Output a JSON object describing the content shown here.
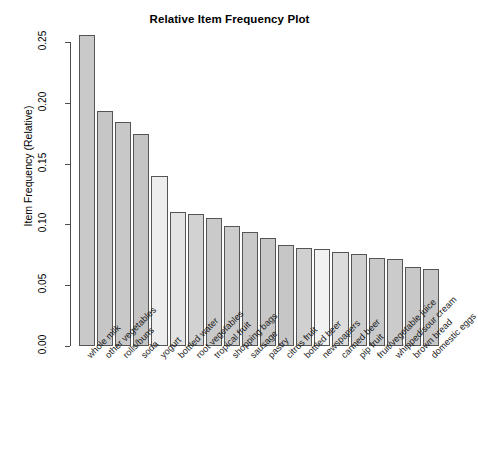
{
  "chart_data": {
    "type": "bar",
    "title": "Relative Item Frequency Plot",
    "xlabel": "",
    "ylabel": "Item Frequency (Relative)",
    "ylim": [
      0.0,
      0.25
    ],
    "yticks": [
      "0.00",
      "0.05",
      "0.10",
      "0.15",
      "0.20",
      "0.25"
    ],
    "ytick_values": [
      0.0,
      0.05,
      0.1,
      0.15,
      0.2,
      0.25
    ],
    "grid": false,
    "legend": "none",
    "categories": [
      "whole milk",
      "other vegetables",
      "rolls/buns",
      "soda",
      "yogurt",
      "bottled water",
      "root vegetables",
      "tropical fruit",
      "shopping bags",
      "sausage",
      "pastry",
      "citrus fruit",
      "bottled beer",
      "newspapers",
      "canned beer",
      "pip fruit",
      "fruit/vegetable juice",
      "whipped/sour cream",
      "brown bread",
      "domestic eggs"
    ],
    "values": [
      0.2555,
      0.1935,
      0.1839,
      0.1744,
      0.1395,
      0.1105,
      0.1089,
      0.1049,
      0.0985,
      0.094,
      0.0889,
      0.0828,
      0.0805,
      0.0798,
      0.0777,
      0.0757,
      0.0723,
      0.0716,
      0.0648,
      0.0634
    ],
    "bar_colors": [
      "#c9c9c9",
      "#c6c6c6",
      "#c8c8c8",
      "#c4c4c4",
      "#ededed",
      "#e3e3e3",
      "#d2d2d2",
      "#cacaca",
      "#cccccc",
      "#c9c9c9",
      "#c7c7c7",
      "#c6c6c6",
      "#d0d0d0",
      "#f2f2f2",
      "#dcdcdc",
      "#cfcfcf",
      "#c9c9c9",
      "#cbcbcb",
      "#c8c8c8",
      "#c7c7c7"
    ]
  }
}
